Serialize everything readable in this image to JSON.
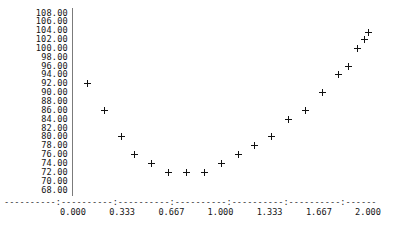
{
  "chart_data": {
    "type": "scatter",
    "title": "",
    "xlabel": "",
    "ylabel": "",
    "xlim": [
      -0.0333,
      2.0333
    ],
    "ylim": [
      68.0,
      108.0
    ],
    "grid": false,
    "legend": null,
    "marker": "+",
    "marker_color": "#111111",
    "axis_color": "#7b7b7b",
    "x_ticks": [
      "0.000",
      "0.333",
      "0.667",
      "1.000",
      "1.333",
      "1.667",
      "2.000"
    ],
    "x_tick_values": [
      0.0,
      0.333,
      0.667,
      1.0,
      1.333,
      1.667,
      2.0
    ],
    "y_ticks": [
      "108.00",
      "106.00",
      "104.00",
      "102.00",
      "100.00",
      "98.00",
      "96.00",
      "94.00",
      "92.00",
      "90.00",
      "88.00",
      "86.00",
      "84.00",
      "82.00",
      "80.00",
      "78.00",
      "76.00",
      "74.00",
      "72.00",
      "70.00",
      "68.00"
    ],
    "y_tick_values": [
      108,
      106,
      104,
      102,
      100,
      98,
      96,
      94,
      92,
      90,
      88,
      86,
      84,
      82,
      80,
      78,
      76,
      74,
      72,
      70,
      68
    ],
    "x": [
      0.105,
      0.21,
      0.316,
      0.421,
      0.526,
      0.632,
      0.737,
      0.842,
      0.947,
      1.053,
      1.158,
      1.263,
      1.368,
      1.474,
      1.579,
      1.684,
      1.789,
      1.895,
      2.0
    ],
    "y": [
      92.0,
      86.0,
      80.0,
      76.0,
      74.0,
      72.0,
      72.0,
      72.0,
      74.0,
      76.0,
      78.0,
      80.0,
      84.0,
      86.0,
      90.0,
      94.0,
      96.0,
      100.0,
      102.0,
      103.6
    ],
    "points": [
      {
        "x": 0.1,
        "y": 92.0
      },
      {
        "x": 0.213,
        "y": 86.0
      },
      {
        "x": 0.326,
        "y": 80.0
      },
      {
        "x": 0.42,
        "y": 76.0
      },
      {
        "x": 0.535,
        "y": 74.0
      },
      {
        "x": 0.645,
        "y": 72.0
      },
      {
        "x": 0.77,
        "y": 72.0
      },
      {
        "x": 0.89,
        "y": 72.0
      },
      {
        "x": 1.005,
        "y": 74.0
      },
      {
        "x": 1.12,
        "y": 76.0
      },
      {
        "x": 1.23,
        "y": 78.0
      },
      {
        "x": 1.345,
        "y": 80.0
      },
      {
        "x": 1.46,
        "y": 84.0
      },
      {
        "x": 1.575,
        "y": 86.0
      },
      {
        "x": 1.69,
        "y": 90.0
      },
      {
        "x": 1.8,
        "y": 94.0
      },
      {
        "x": 1.87,
        "y": 96.0
      },
      {
        "x": 1.93,
        "y": 100.0
      },
      {
        "x": 1.975,
        "y": 102.0
      },
      {
        "x": 2.0,
        "y": 103.6
      }
    ],
    "dashed_axis_rule": "----------:----------:----------:----------:----------:----------:---------:"
  }
}
